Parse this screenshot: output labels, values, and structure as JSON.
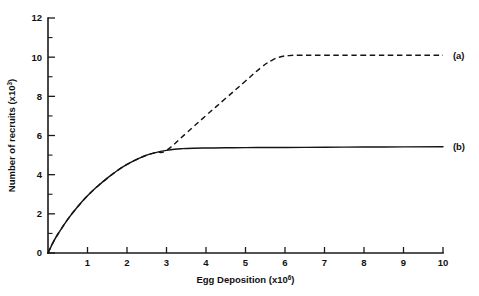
{
  "chart_data": {
    "type": "line",
    "title": "",
    "xlabel": "Egg Deposition (x10",
    "xlabel_sup": "6",
    "xlabel_tail": ")",
    "ylabel": "Number of recruits (x10",
    "ylabel_sup": "3",
    "ylabel_tail": ")",
    "xlim": [
      0,
      10
    ],
    "ylim": [
      0,
      12
    ],
    "grid": false,
    "legend_position": "right-inline",
    "x_ticks": [
      0,
      1,
      2,
      3,
      4,
      5,
      6,
      7,
      8,
      9,
      10
    ],
    "x_ticklabels": [
      "",
      "1",
      "2",
      "3",
      "4",
      "5",
      "6",
      "7",
      "8",
      "9",
      "10"
    ],
    "y_ticks": [
      0,
      2,
      4,
      6,
      8,
      10,
      12
    ],
    "y_ticklabels": [
      "0",
      "2",
      "4",
      "6",
      "8",
      "10",
      "12"
    ],
    "y_minor_ticks": [
      1,
      3,
      5,
      7,
      9,
      11
    ],
    "series": [
      {
        "name": "(a)",
        "label": "(a)",
        "style": "dashed",
        "color": "#141414",
        "x": [
          0,
          0.15,
          0.3,
          0.5,
          0.75,
          1.0,
          1.25,
          1.5,
          1.75,
          2.0,
          2.25,
          2.5,
          2.75,
          3.0,
          3.5,
          4.0,
          4.5,
          5.0,
          5.4,
          5.7,
          5.9,
          6.1,
          6.4,
          7.0,
          8.0,
          9.0,
          10.0
        ],
        "y": [
          0,
          0.62,
          1.12,
          1.72,
          2.36,
          2.92,
          3.4,
          3.82,
          4.2,
          4.52,
          4.78,
          5.0,
          5.14,
          5.24,
          6.12,
          7.02,
          7.9,
          8.78,
          9.48,
          9.88,
          10.02,
          10.08,
          10.1,
          10.1,
          10.1,
          10.1,
          10.1
        ]
      },
      {
        "name": "(b)",
        "label": "(b)",
        "style": "solid",
        "color": "#141414",
        "x": [
          0,
          0.15,
          0.3,
          0.5,
          0.75,
          1.0,
          1.25,
          1.5,
          1.75,
          2.0,
          2.25,
          2.5,
          2.75,
          3.0,
          3.2,
          3.4,
          3.7,
          4.0,
          4.5,
          5.0,
          6.0,
          7.0,
          8.0,
          9.0,
          10.0
        ],
        "y": [
          0,
          0.62,
          1.12,
          1.72,
          2.36,
          2.92,
          3.4,
          3.82,
          4.2,
          4.52,
          4.78,
          5.0,
          5.14,
          5.24,
          5.3,
          5.33,
          5.35,
          5.36,
          5.37,
          5.38,
          5.39,
          5.4,
          5.41,
          5.42,
          5.43
        ]
      }
    ],
    "annotations": [
      {
        "text": "(a)",
        "x": 10.25,
        "y": 10.1
      },
      {
        "text": "(b)",
        "x": 10.25,
        "y": 5.43
      }
    ]
  }
}
